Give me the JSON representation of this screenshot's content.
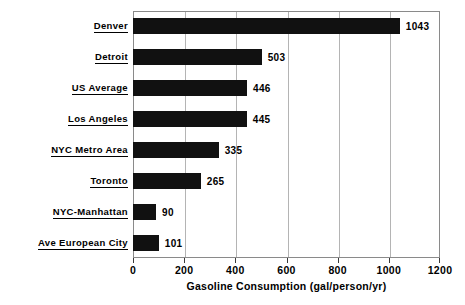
{
  "chart_data": {
    "type": "bar",
    "orientation": "horizontal",
    "title": "",
    "xlabel": "Gasoline Consumption (gal/person/yr)",
    "ylabel": "",
    "categories": [
      "Denver",
      "Detroit",
      "US Average",
      "Los Angeles",
      "NYC Metro Area",
      "Toronto",
      "NYC-Manhattan",
      "Ave European City"
    ],
    "values": [
      1043,
      503,
      446,
      445,
      335,
      265,
      90,
      101
    ],
    "value_labels": [
      "1043",
      "503",
      "446",
      "445",
      "335",
      "265",
      "90",
      "101"
    ],
    "xlim": [
      0,
      1200
    ],
    "xticks": [
      0,
      200,
      400,
      600,
      800,
      1000,
      1200
    ],
    "xtick_labels": [
      "0",
      "200",
      "400",
      "600",
      "800",
      "1000",
      "1200"
    ],
    "grid": "vertical",
    "legend": "none",
    "bar_color": "#111111",
    "grid_color": "#b4b4b4",
    "frame_color": "#8a8a8a",
    "text_color": "#000000"
  }
}
